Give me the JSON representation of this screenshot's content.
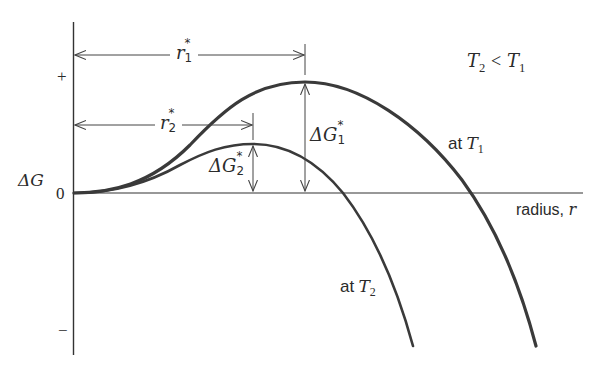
{
  "diagram": {
    "type": "free-energy-vs-radius",
    "axes": {
      "y_label": "ΔG",
      "y_ticks": {
        "plus": "+",
        "zero": "0",
        "minus": "−"
      },
      "x_label": "radius, r",
      "x_label_text": "radius,",
      "x_label_var": "r"
    },
    "condition": {
      "lhs": "T",
      "lhs_sub": "2",
      "op": "<",
      "rhs": "T",
      "rhs_sub": "1"
    },
    "curves": [
      {
        "name": "T1",
        "label_prefix": "at",
        "label_var": "T",
        "label_sub": "1",
        "color": "#3a3a3a"
      },
      {
        "name": "T2",
        "label_prefix": "at",
        "label_var": "T",
        "label_sub": "2",
        "color": "#3a3a3a"
      }
    ],
    "annotations": {
      "r1": {
        "var": "r",
        "sup": "*",
        "sub": "1"
      },
      "r2": {
        "var": "r",
        "sup": "*",
        "sub": "2"
      },
      "dG1": {
        "var": "ΔG",
        "sup": "*",
        "sub": "1"
      },
      "dG2": {
        "var": "ΔG",
        "sup": "*",
        "sub": "2"
      }
    },
    "colors": {
      "line": "#333333",
      "text": "#2b2b2b",
      "background": "#ffffff"
    }
  }
}
